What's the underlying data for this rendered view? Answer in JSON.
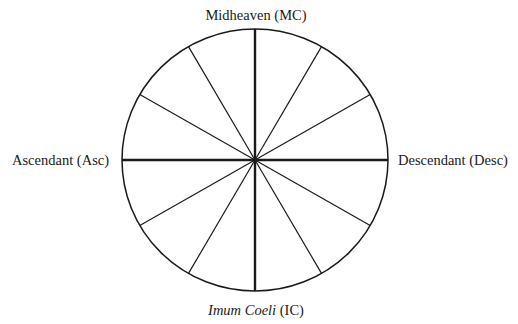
{
  "diagram": {
    "type": "astrological-house-wheel",
    "houses": 12,
    "labels": {
      "top": "Midheaven (MC)",
      "left": "Ascendant (Asc)",
      "right": "Descendant (Desc)",
      "bottom_italic": "Imum Coeli",
      "bottom_rest": " (IC)"
    },
    "colors": {
      "line": "#1a1a1a",
      "background": "#ffffff"
    }
  }
}
